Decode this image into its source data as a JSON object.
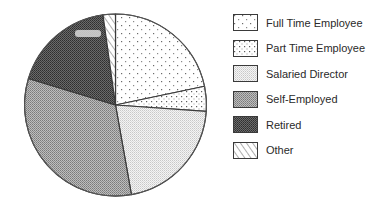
{
  "chart_data": {
    "type": "pie",
    "title": "",
    "legend_position": "right",
    "start_angle_deg": 0,
    "direction": "clockwise",
    "categories": [
      "Full Time Employee",
      "Part Time Employee",
      "Salaried Director",
      "Self-Employed",
      "Retired",
      "Other"
    ],
    "values": [
      21.7,
      4.4,
      21.1,
      32.5,
      18.1,
      2.2
    ],
    "units": "percent (estimated from slice angles)",
    "patterns": [
      "sparse-dots",
      "dense-dots",
      "fine-light-stipple",
      "medium-grey-checker",
      "dark-grey-checker",
      "diagonal-hatch"
    ]
  },
  "legend": {
    "items": [
      {
        "label": "Full Time Employee",
        "pattern": "sparse-dots"
      },
      {
        "label": "Part Time Employee",
        "pattern": "dense-dots"
      },
      {
        "label": "Salaried Director",
        "pattern": "fine-light-stipple"
      },
      {
        "label": "Self-Employed",
        "pattern": "medium-grey-checker"
      },
      {
        "label": "Retired",
        "pattern": "dark-grey-checker"
      },
      {
        "label": "Other",
        "pattern": "diagonal-hatch"
      }
    ]
  },
  "colors": {
    "outline": "#3a3a3a",
    "text": "#2a2a2a",
    "background": "#ffffff"
  }
}
